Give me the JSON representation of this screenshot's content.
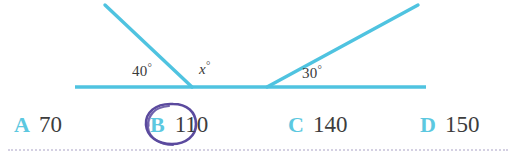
{
  "diagram": {
    "line_color": "#4fc3e0",
    "baseline": {
      "x1": 75,
      "y1": 87,
      "x2": 426,
      "y2": 87
    },
    "left_ray": {
      "x1": 192,
      "y1": 87,
      "x2": 105,
      "y2": 5
    },
    "right_ray": {
      "x1": 267,
      "y1": 87,
      "x2": 418,
      "y2": 5
    },
    "labels": {
      "left_angle": "40",
      "unknown_angle": "x",
      "right_angle": "30",
      "degree_symbol": "°"
    }
  },
  "answers": {
    "letter_color": "#5cc8e0",
    "value_color": "#3d3d3d",
    "options": [
      {
        "letter": "A",
        "value": "70",
        "selected": false
      },
      {
        "letter": "B",
        "value": "110",
        "selected": true
      },
      {
        "letter": "C",
        "value": "140",
        "selected": false
      },
      {
        "letter": "D",
        "value": "150",
        "selected": false
      }
    ]
  },
  "annotation": {
    "type": "hand-drawn-circle",
    "color": "#5b4a9e",
    "targets": "B"
  }
}
